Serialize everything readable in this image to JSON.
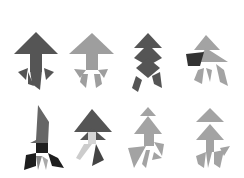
{
  "diagram": {
    "type": "tangram-figure-grid",
    "rows": 2,
    "columns": 4,
    "colors": {
      "background": "#ffffff",
      "dark": "#555555",
      "mid": "#8a8a8a",
      "light": "#a3a3a3",
      "pale": "#c4c4c4",
      "black": "#1e1e1e"
    },
    "figures": [
      {
        "id": "fig-1",
        "row": 1,
        "col": 1,
        "style": "dark arrow with fringed legs"
      },
      {
        "id": "fig-2",
        "row": 1,
        "col": 2,
        "style": "light arrow with split legs"
      },
      {
        "id": "fig-3",
        "row": 1,
        "col": 3,
        "style": "dark stacked diamond figure"
      },
      {
        "id": "fig-4",
        "row": 1,
        "col": 4,
        "style": "light figure with dark parallelogram"
      },
      {
        "id": "fig-5",
        "row": 2,
        "col": 1,
        "style": "dark rocket with black base"
      },
      {
        "id": "fig-6",
        "row": 2,
        "col": 2,
        "style": "dark arrow with pale square"
      },
      {
        "id": "fig-7",
        "row": 2,
        "col": 3,
        "style": "light figure kicking"
      },
      {
        "id": "fig-8",
        "row": 2,
        "col": 4,
        "style": "light figure standing"
      }
    ]
  }
}
